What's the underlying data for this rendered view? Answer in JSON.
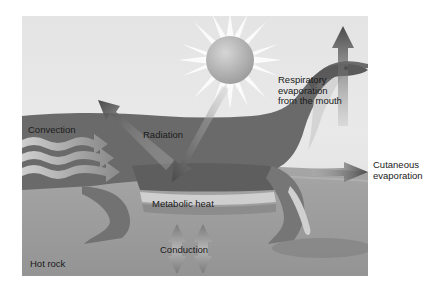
{
  "diagram": {
    "colors": {
      "background": "#ffffff",
      "sky": "#e6e6e6",
      "ground": "#9a9a9a",
      "lizard_body": "#6e6e6e",
      "metabolic_band": "#7a7a7a",
      "arrow_dark": "#4a4a4a",
      "sun": "#bdbdbd",
      "text": "#1a1a1a"
    },
    "labels": {
      "convection": "Convection",
      "radiation": "Radiation",
      "respiratory": "Respiratory\nevaporation\nfrom the mouth",
      "cutaneous": "Cutaneous\nevaporation",
      "metabolic": "Metabolic heat",
      "conduction": "Conduction",
      "hot_rock": "Hot rock"
    },
    "elements": [
      {
        "name": "sun",
        "icon": "sun-icon"
      },
      {
        "name": "lizard",
        "icon": "lizard-illustration"
      },
      {
        "name": "convection-arrows",
        "count": 3,
        "direction": "right"
      },
      {
        "name": "radiation-arrow-in",
        "direction": "down-left from sun"
      },
      {
        "name": "radiation-arrow-out",
        "direction": "up-left"
      },
      {
        "name": "respiratory-arrow",
        "direction": "up"
      },
      {
        "name": "cutaneous-arrow",
        "direction": "right"
      },
      {
        "name": "conduction-arrows",
        "count": 2,
        "direction": "up-and-down"
      }
    ]
  }
}
